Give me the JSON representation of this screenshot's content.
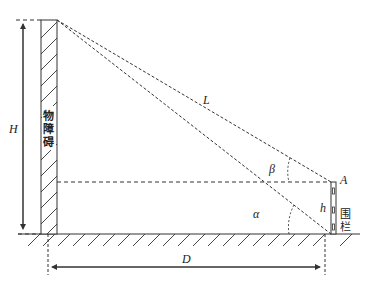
{
  "labels": {
    "H": "H",
    "L": "L",
    "beta": "β",
    "alpha": "α",
    "A": "A",
    "h": "h",
    "D": "D"
  },
  "obstacle": {
    "chars": [
      "物",
      "障",
      "碍"
    ]
  },
  "fence": {
    "chars": [
      "围",
      "栏"
    ]
  },
  "colors": {
    "line": "#333333",
    "background": "#ffffff"
  }
}
